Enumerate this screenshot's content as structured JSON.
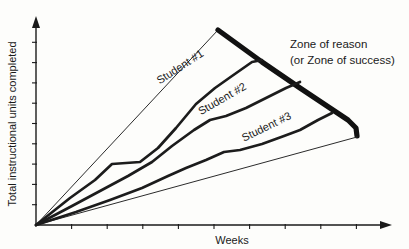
{
  "chart_data": {
    "type": "line",
    "title": "",
    "xlabel": "Weeks",
    "ylabel": "Total instructional units completed",
    "grid": false,
    "legend_position": "inline-labels",
    "axis": {
      "x_tick_count": 9,
      "y_tick_count": 9,
      "x_has_arrow": true,
      "y_has_arrow": true,
      "x_tick_labels": [],
      "y_tick_labels": [],
      "origin_px": [
        36,
        225
      ],
      "x_range_px": [
        36,
        392
      ],
      "y_range_px": [
        225,
        22
      ]
    },
    "annotations": [
      {
        "name": "zone-of-reason",
        "lines": [
          "Zone of reason",
          "(or Zone of success)"
        ],
        "x_px": 290,
        "y_px": 44
      }
    ],
    "zone": {
      "name": "Zone of reason (or Zone of success)",
      "upper_bound_label": "maximum expected progress",
      "lower_bound_label": "minimum expected progress",
      "upper_thin_points": [
        [
          36,
          225
        ],
        [
          218,
          30
        ]
      ],
      "upper_thick_points": [
        [
          218,
          30
        ],
        [
          262,
          62
        ],
        [
          300,
          88
        ],
        [
          330,
          108
        ],
        [
          348,
          120
        ],
        [
          356,
          128
        ],
        [
          357,
          136
        ]
      ],
      "lower_thin_points": [
        [
          36,
          225
        ],
        [
          357,
          137
        ]
      ]
    },
    "series": [
      {
        "name": "Student #1",
        "label": "Student #1",
        "label_x_px": 182,
        "label_y_px": 70,
        "label_rotation_deg": -33,
        "points": [
          [
            36,
            225
          ],
          [
            70,
            198
          ],
          [
            95,
            180
          ],
          [
            112,
            164
          ],
          [
            140,
            162
          ],
          [
            158,
            148
          ],
          [
            176,
            128
          ],
          [
            196,
            104
          ],
          [
            215,
            88
          ],
          [
            232,
            76
          ],
          [
            252,
            62
          ],
          [
            262,
            60
          ]
        ]
      },
      {
        "name": "Student #2",
        "label": "Student #2",
        "label_x_px": 224,
        "label_y_px": 102,
        "label_rotation_deg": -30,
        "points": [
          [
            36,
            225
          ],
          [
            72,
            206
          ],
          [
            100,
            191
          ],
          [
            128,
            176
          ],
          [
            152,
            162
          ],
          [
            172,
            146
          ],
          [
            194,
            130
          ],
          [
            210,
            120
          ],
          [
            226,
            116
          ],
          [
            246,
            108
          ],
          [
            266,
            98
          ],
          [
            286,
            88
          ],
          [
            300,
            82
          ]
        ]
      },
      {
        "name": "Student #3",
        "label": "Student #3",
        "label_x_px": 268,
        "label_y_px": 130,
        "label_rotation_deg": -26,
        "points": [
          [
            36,
            225
          ],
          [
            76,
            212
          ],
          [
            110,
            200
          ],
          [
            142,
            188
          ],
          [
            168,
            176
          ],
          [
            186,
            168
          ],
          [
            206,
            160
          ],
          [
            224,
            152
          ],
          [
            240,
            150
          ],
          [
            262,
            144
          ],
          [
            284,
            136
          ],
          [
            300,
            130
          ],
          [
            318,
            120
          ],
          [
            332,
            113
          ]
        ]
      }
    ]
  },
  "colors": {
    "background": "#fdfdfb",
    "ink": "#1a1a1a",
    "zone_boundary": "#111111",
    "series_line": "#1c1c1c"
  }
}
